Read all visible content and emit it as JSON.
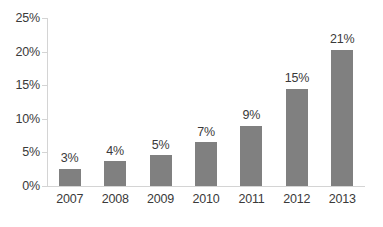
{
  "chart_data": {
    "type": "bar",
    "title": "",
    "subtitle": "",
    "xlabel": "",
    "ylabel": "",
    "categories": [
      "2007",
      "2008",
      "2009",
      "2010",
      "2011",
      "2012",
      "2013"
    ],
    "values": [
      2.6,
      3.7,
      4.6,
      6.5,
      9.0,
      14.5,
      20.3
    ],
    "data_labels": [
      "3%",
      "4%",
      "5%",
      "7%",
      "9%",
      "15%",
      "21%"
    ],
    "ylim": [
      0,
      25
    ],
    "ytick_values": [
      0,
      5,
      10,
      15,
      20,
      25
    ],
    "ytick_labels": [
      "0%",
      "5%",
      "10%",
      "15%",
      "20%",
      "25%"
    ],
    "grid": false,
    "legend": false,
    "legend_position": "none",
    "series": [
      {
        "name": "",
        "color": "#808080",
        "values": [
          2.6,
          3.7,
          4.6,
          6.5,
          9.0,
          14.5,
          20.3
        ]
      }
    ]
  },
  "style": {
    "bar_color": "#808080",
    "axis_color": "#d4d4d4",
    "text_color": "#3a3a3a",
    "background": "#ffffff"
  }
}
